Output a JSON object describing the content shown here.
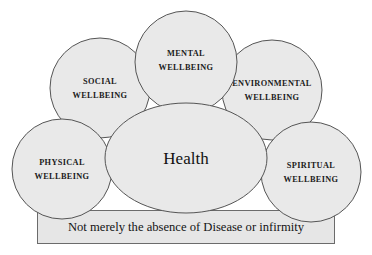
{
  "diagram": {
    "core": {
      "label": "Health",
      "shape": "ellipse"
    },
    "bubbles": [
      {
        "id": "social",
        "line1": "SOCIAL",
        "line2": "WELLBEING",
        "shape": "circle"
      },
      {
        "id": "mental",
        "line1": "MENTAL",
        "line2": "WELLBEING",
        "shape": "circle"
      },
      {
        "id": "environmental",
        "line1": "ENVIRONMENTAL",
        "line2": "WELLBEING",
        "shape": "circle"
      },
      {
        "id": "physical",
        "line1": "PHYSICAL",
        "line2": "WELLBEING",
        "shape": "circle"
      },
      {
        "id": "spiritual",
        "line1": "SPIRITUAL",
        "line2": "WELLBEING",
        "shape": "circle"
      }
    ],
    "base_bar": {
      "label": "Not merely the absence of Disease or infirmity"
    },
    "colors": {
      "bubble_fill": "#e9e9e9",
      "bubble_stroke": "#555555",
      "bar_fill": "#e6e6e6",
      "bar_stroke": "#6b6b6b",
      "text": "#141414",
      "background": "#ffffff"
    }
  }
}
